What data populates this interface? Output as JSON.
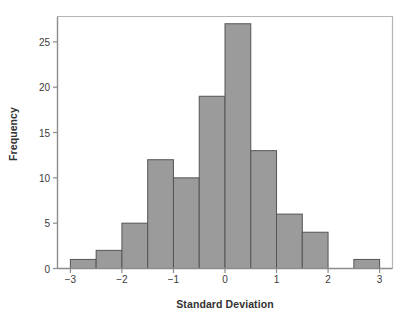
{
  "chart_data": {
    "type": "bar",
    "title": "",
    "subtitle": "",
    "xlabel": "Standard Deviation",
    "ylabel": "Frequency",
    "bin_width": 0.5,
    "bin_starts": [
      -3.0,
      -2.5,
      -2.0,
      -1.5,
      -1.0,
      -0.5,
      0.0,
      0.5,
      1.0,
      1.5,
      2.0,
      2.5
    ],
    "bin_ends": [
      -2.5,
      -2.0,
      -1.5,
      -1.0,
      -0.5,
      0.0,
      0.5,
      1.0,
      1.5,
      2.0,
      2.5,
      3.0
    ],
    "categories": [
      "-3.0 to -2.5",
      "-2.5 to -2.0",
      "-2.0 to -1.5",
      "-1.5 to -1.0",
      "-1.0 to -0.5",
      "-0.5 to 0.0",
      "0.0 to 0.5",
      "0.5 to 1.0",
      "1.0 to 1.5",
      "1.5 to 2.0",
      "2.0 to 2.5",
      "2.5 to 3.0"
    ],
    "values": [
      1,
      2,
      5,
      12,
      10,
      19,
      27,
      13,
      6,
      4,
      0,
      1
    ],
    "xlim": [
      -3.25,
      3.25
    ],
    "ylim": [
      0,
      27.8
    ],
    "xticks": [
      -3,
      -2,
      -1,
      0,
      1,
      2,
      3
    ],
    "xtick_labels": [
      "−3",
      "−2",
      "−1",
      "0",
      "1",
      "2",
      "3"
    ],
    "yticks": [
      0,
      5,
      10,
      15,
      20,
      25
    ],
    "ytick_labels": [
      "0",
      "5",
      "10",
      "15",
      "20",
      "25"
    ],
    "grid": false,
    "legend": null,
    "colors": {
      "bar_fill": "#9b9b9b",
      "bar_stroke": "#555555",
      "axis": "#8c8c8c",
      "text": "#333333",
      "background": "#ffffff"
    }
  }
}
